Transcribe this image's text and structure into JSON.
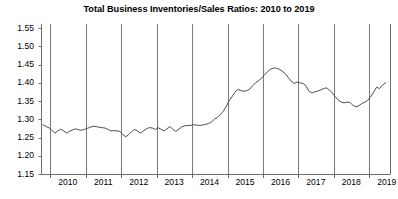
{
  "chart_data": {
    "type": "line",
    "title": "Total Business Inventories/Sales Ratios: 2010 to 2019",
    "xlabel": "",
    "ylabel": "",
    "ylim": [
      1.15,
      1.55
    ],
    "xlim": [
      2009.75,
      2019.6
    ],
    "grid": true,
    "grid_axis": "x",
    "legend": false,
    "line_color": "#4d4d4d",
    "x_tick_labels": [
      "2010",
      "2011",
      "2012",
      "2013",
      "2014",
      "2015",
      "2016",
      "2017",
      "2018",
      "2019"
    ],
    "x_tick_values": [
      2010,
      2011,
      2012,
      2013,
      2014,
      2015,
      2016,
      2017,
      2018,
      2019
    ],
    "y_tick_labels": [
      "1.15",
      "1.20",
      "1.25",
      "1.30",
      "1.35",
      "1.40",
      "1.45",
      "1.50",
      "1.55"
    ],
    "y_tick_values": [
      1.15,
      1.2,
      1.25,
      1.3,
      1.35,
      1.4,
      1.45,
      1.5,
      1.55
    ],
    "series": [
      {
        "name": "Total Business Inventories/Sales Ratio",
        "x": [
          2009.79,
          2009.88,
          2009.96,
          2010.04,
          2010.13,
          2010.21,
          2010.29,
          2010.38,
          2010.46,
          2010.54,
          2010.63,
          2010.71,
          2010.79,
          2010.88,
          2010.96,
          2011.04,
          2011.13,
          2011.21,
          2011.29,
          2011.38,
          2011.46,
          2011.54,
          2011.63,
          2011.71,
          2011.79,
          2011.88,
          2011.96,
          2012.04,
          2012.13,
          2012.21,
          2012.29,
          2012.38,
          2012.46,
          2012.54,
          2012.63,
          2012.71,
          2012.79,
          2012.88,
          2012.96,
          2013.04,
          2013.13,
          2013.21,
          2013.29,
          2013.38,
          2013.46,
          2013.54,
          2013.63,
          2013.71,
          2013.79,
          2013.88,
          2013.96,
          2014.04,
          2014.13,
          2014.21,
          2014.29,
          2014.38,
          2014.46,
          2014.54,
          2014.63,
          2014.71,
          2014.79,
          2014.88,
          2014.96,
          2015.04,
          2015.13,
          2015.21,
          2015.29,
          2015.38,
          2015.46,
          2015.54,
          2015.63,
          2015.71,
          2015.79,
          2015.88,
          2015.96,
          2016.04,
          2016.13,
          2016.21,
          2016.29,
          2016.38,
          2016.46,
          2016.54,
          2016.63,
          2016.71,
          2016.79,
          2016.88,
          2016.96,
          2017.04,
          2017.13,
          2017.21,
          2017.29,
          2017.38,
          2017.46,
          2017.54,
          2017.63,
          2017.71,
          2017.79,
          2017.88,
          2017.96,
          2018.04,
          2018.13,
          2018.21,
          2018.29,
          2018.38,
          2018.46,
          2018.54,
          2018.63,
          2018.71,
          2018.79,
          2018.88,
          2018.96,
          2019.04,
          2019.13,
          2019.21,
          2019.29,
          2019.38,
          2019.46
        ],
        "values": [
          1.285,
          1.28,
          1.277,
          1.27,
          1.262,
          1.268,
          1.273,
          1.268,
          1.262,
          1.267,
          1.271,
          1.274,
          1.271,
          1.27,
          1.272,
          1.275,
          1.278,
          1.281,
          1.28,
          1.278,
          1.277,
          1.276,
          1.272,
          1.268,
          1.269,
          1.268,
          1.267,
          1.258,
          1.252,
          1.258,
          1.266,
          1.272,
          1.268,
          1.262,
          1.268,
          1.274,
          1.277,
          1.276,
          1.272,
          1.277,
          1.272,
          1.268,
          1.274,
          1.28,
          1.272,
          1.267,
          1.273,
          1.279,
          1.282,
          1.283,
          1.283,
          1.285,
          1.284,
          1.283,
          1.284,
          1.286,
          1.288,
          1.292,
          1.3,
          1.305,
          1.312,
          1.322,
          1.334,
          1.35,
          1.362,
          1.374,
          1.382,
          1.378,
          1.377,
          1.378,
          1.383,
          1.392,
          1.4,
          1.406,
          1.412,
          1.422,
          1.43,
          1.437,
          1.44,
          1.44,
          1.437,
          1.432,
          1.425,
          1.415,
          1.405,
          1.398,
          1.402,
          1.4,
          1.398,
          1.392,
          1.378,
          1.372,
          1.375,
          1.377,
          1.38,
          1.384,
          1.386,
          1.38,
          1.372,
          1.362,
          1.352,
          1.347,
          1.345,
          1.347,
          1.346,
          1.338,
          1.334,
          1.337,
          1.343,
          1.347,
          1.352,
          1.362,
          1.375,
          1.388,
          1.384,
          1.394,
          1.4
        ]
      }
    ]
  }
}
